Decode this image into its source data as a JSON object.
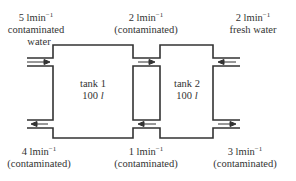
{
  "diagram": {
    "type": "two-tank mixing system",
    "flows": {
      "inlet_tank1": {
        "rate": "5 lmin",
        "exp": "−1",
        "desc": "contaminated",
        "desc2": "water"
      },
      "tank1_to_tank2": {
        "rate": "2 lmin",
        "exp": "−1",
        "desc": "(contaminated)"
      },
      "inlet_tank2": {
        "rate": "2 lmin",
        "exp": "−1",
        "desc": "fresh water"
      },
      "outlet_tank1": {
        "rate": "4 lmin",
        "exp": "−1",
        "desc": "(contaminated)"
      },
      "tank2_to_tank1": {
        "rate": "1 lmin",
        "exp": "−1",
        "desc": "(contaminated)"
      },
      "outlet_tank2": {
        "rate": "3 lmin",
        "exp": "−1",
        "desc": "(contaminated)"
      }
    },
    "tanks": [
      {
        "name": "tank 1",
        "volume": "100",
        "unit": "l"
      },
      {
        "name": "tank 2",
        "volume": "100",
        "unit": "l"
      }
    ],
    "colors": {
      "line": "#333333",
      "background": "#ffffff"
    }
  }
}
